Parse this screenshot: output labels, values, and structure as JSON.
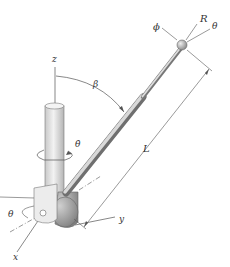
{
  "diagram": {
    "labels": {
      "z_axis": "z",
      "x_axis": "x",
      "y_axis": "y",
      "beta": "β",
      "theta_dot": "θ̇",
      "theta_base": "θ",
      "length": "L",
      "phi": "ϕ",
      "R": "R",
      "theta_tip": "θ"
    },
    "colors": {
      "line": "#555555",
      "column_fill": "#e4e4e4",
      "column_shade": "#bdbdbd",
      "boom_fill": "#b8b8b8",
      "ball_fill": "#a9a9a9",
      "hub_fill": "#9a9a9a"
    }
  }
}
